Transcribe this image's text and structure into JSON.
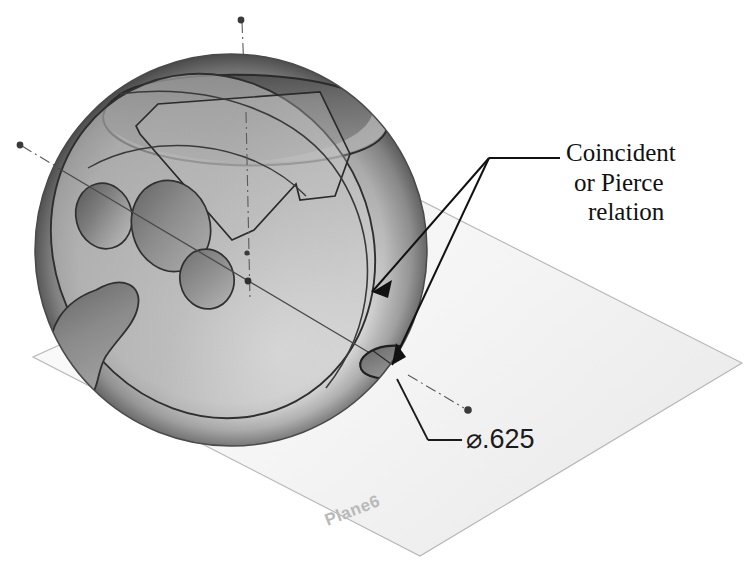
{
  "figure": {
    "kind": "cad-3d-illustration",
    "caption_text": "Coincident or Pierce relation",
    "callout": {
      "line1": "Coincident",
      "line2": "or Pierce",
      "line3": "relation",
      "leader_count": 2
    },
    "dimension": {
      "symbol": "⌀",
      "value": ".625",
      "label": "⌀.625"
    },
    "plane": {
      "name": "Plane6",
      "fill_color": "#f7f7f7",
      "edge_color": "#b5b5b5"
    },
    "model": {
      "name": "sphere",
      "surface_light": "#e8e8e8",
      "surface_mid": "#a8a8a8",
      "surface_dark": "#6e6e6e",
      "edge_color": "#2b2b2b",
      "highlight_color": "#f2f2f2",
      "dimple_count": 4,
      "hole_count": 1,
      "axis_color": "#555555",
      "axis_style": "dash-dot"
    },
    "annotation_color": "#111111",
    "background_color": "#ffffff"
  }
}
